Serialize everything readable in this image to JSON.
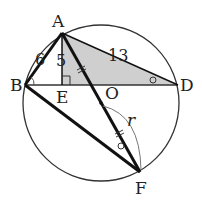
{
  "figure": {
    "points": {
      "A": "A",
      "B": "B",
      "D": "D",
      "E": "E",
      "O": "O",
      "F": "F"
    },
    "lengths": {
      "AB": "6",
      "AE": "5",
      "AD": "13",
      "OF": "r"
    },
    "colors": {
      "stroke": "#222222",
      "shade": "#cfcfcf",
      "background": "#ffffff"
    },
    "markers": {
      "right_angle_at": "E",
      "equal_ticks": [
        "AO",
        "OF"
      ],
      "equal_angles": [
        "ABE",
        "ADE",
        "AFO"
      ]
    }
  }
}
